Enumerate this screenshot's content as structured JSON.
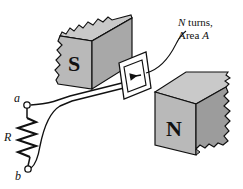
{
  "figure": {
    "background_color": "#ffffff",
    "stroke_color": "#111111"
  },
  "magnets": {
    "south": {
      "pole_label": "S",
      "face_color": "#b9b9b9",
      "top_color": "#c9c9c9",
      "side_color": "#a8a8a8",
      "broken_edge": "jagged-left"
    },
    "north": {
      "pole_label": "N",
      "face_color": "#b9b9b9",
      "top_color": "#c9c9c9",
      "side_color": "#9c9c9c",
      "broken_edge": "jagged-right"
    }
  },
  "coil": {
    "label_line1": "N turns,",
    "label_line2_prefix": "Area ",
    "label_line2_var": "A",
    "arrow_name": "field-direction-arrow",
    "leader_name": "coil-leader-line"
  },
  "circuit": {
    "terminal_top": "a",
    "terminal_bottom": "b",
    "resistor_label": "R",
    "wire_count": 2
  }
}
